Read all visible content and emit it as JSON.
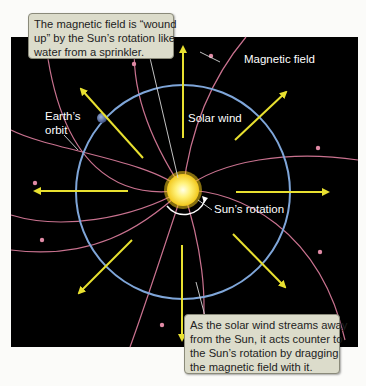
{
  "figure": {
    "callout_top": {
      "lines": [
        "The magnetic field is “wound",
        "up” by the Sun’s rotation like",
        "water from a sprinkler."
      ]
    },
    "callout_bottom": {
      "lines": [
        "As the solar wind streams away",
        "from the Sun, it acts counter to",
        "the Sun’s rotation by dragging",
        "the magnetic field with it."
      ]
    },
    "labels": {
      "magnetic_field": "Magnetic field",
      "earths_orbit_line1": "Earth’s",
      "earths_orbit_line2": "orbit",
      "solar_wind": "Solar wind",
      "suns_rotation": "Sun’s rotation"
    },
    "colors": {
      "background": "#000000",
      "orbit": "#7fa6d9",
      "field_lines": "#c9728f",
      "solar_wind_arrows": "#e8e030",
      "sun": "#fff27a",
      "callout_fill": "#dcdccb"
    }
  }
}
